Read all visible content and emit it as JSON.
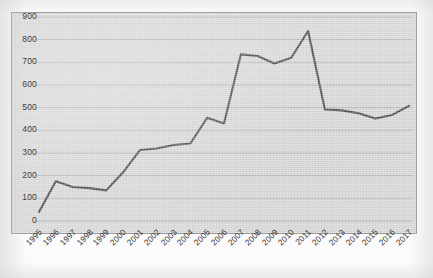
{
  "chart_data": {
    "type": "line",
    "title": "",
    "subtitle": "",
    "xlabel": "",
    "ylabel": "",
    "categories": [
      "1995",
      "1996",
      "1997",
      "1998",
      "1999",
      "2000",
      "2001",
      "2002",
      "2003",
      "2004",
      "2005",
      "2006",
      "2007",
      "2008",
      "2009",
      "2010",
      "2011",
      "2012",
      "2013",
      "2014",
      "2015",
      "2016",
      "2017"
    ],
    "series": [
      {
        "name": "",
        "values": [
          40,
          175,
          150,
          145,
          135,
          215,
          313,
          320,
          335,
          342,
          455,
          430,
          735,
          728,
          695,
          720,
          838,
          492,
          488,
          475,
          452,
          468,
          508
        ]
      }
    ],
    "ytick_labels": [
      "900",
      "800",
      "700",
      "600",
      "500",
      "400",
      "300",
      "200",
      "100",
      "0"
    ],
    "ytick_values": [
      900,
      800,
      700,
      600,
      500,
      400,
      300,
      200,
      100,
      0
    ],
    "ylim": [
      0,
      900
    ],
    "ystep": 100,
    "grid": "horizontal",
    "legend": "none",
    "line_color": "#4d4d4d",
    "plot_bg_color": "#d9d9d9",
    "grid_color": "#a8a8a8",
    "border_color": "#9a9a9a",
    "tick_label_color": "#3a3a3a",
    "xlabel_rotation": -45
  }
}
